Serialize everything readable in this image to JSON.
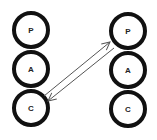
{
  "diagram": {
    "type": "transactional-analysis",
    "left_person": {
      "ego_states": [
        {
          "label": "P"
        },
        {
          "label": "A"
        },
        {
          "label": "C"
        }
      ]
    },
    "right_person": {
      "ego_states": [
        {
          "label": "P"
        },
        {
          "label": "A"
        },
        {
          "label": "C"
        }
      ]
    },
    "transactions": [
      {
        "from": "left.C",
        "to": "right.P",
        "direction": "up-right"
      },
      {
        "from": "right.P",
        "to": "left.C",
        "direction": "down-left"
      }
    ],
    "colors": {
      "circle_stroke": "#111111",
      "arrow": "#555555",
      "background": "#ffffff"
    }
  }
}
